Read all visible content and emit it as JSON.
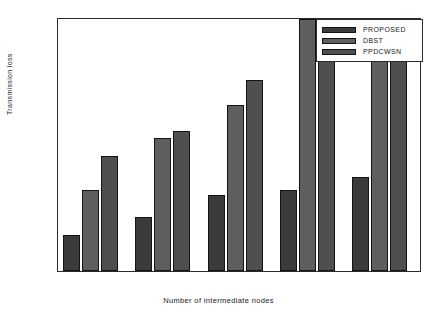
{
  "chart_data": {
    "type": "bar",
    "title": "",
    "xlabel": "Number of  intermediate nodes",
    "ylabel": "Transmission loss",
    "categories": [
      "1",
      "2",
      "3",
      "4",
      "5"
    ],
    "ylim": [
      0,
      0.7
    ],
    "yticks": [
      "0",
      "0.1",
      "0.2",
      "0.3",
      "0.4",
      "0.5",
      "0.6",
      "0.7"
    ],
    "ytick_values": [
      0,
      0.1,
      0.2,
      0.3,
      0.4,
      0.5,
      0.6,
      0.7
    ],
    "grid": false,
    "legend_position": "upper right",
    "series": [
      {
        "name": "PROPOSED",
        "color": "#3b3b3b",
        "values": [
          0.1,
          0.15,
          0.21,
          0.226,
          0.262
        ]
      },
      {
        "name": "DBST",
        "color": "#5e5e5e",
        "values": [
          0.225,
          0.37,
          0.46,
          0.7,
          0.7
        ]
      },
      {
        "name": "PPDCWSN",
        "color": "#4f4f4f",
        "values": [
          0.32,
          0.39,
          0.53,
          0.7,
          0.7
        ]
      }
    ]
  },
  "legend": {
    "items": [
      {
        "label": "PROPOSED",
        "color": "#3b3b3b"
      },
      {
        "label": "DBST",
        "color": "#5e5e5e"
      },
      {
        "label": "PPDCWSN",
        "color": "#4f4f4f"
      }
    ]
  },
  "axes": {
    "y_title": "Transmission loss",
    "x_title": "Number of  intermediate nodes"
  }
}
